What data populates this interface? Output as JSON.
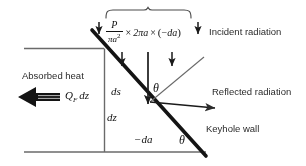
{
  "figure": {
    "type": "schematic-diagram"
  },
  "formula": {
    "numerator": "P",
    "denominator_base": "πa",
    "denominator_exp": "2",
    "times1": "×",
    "term2": "2πa",
    "times2": "×",
    "open_paren": "(",
    "minus": "−",
    "term3": "da",
    "close_paren": ")"
  },
  "labels": {
    "incident": "Incident radiation",
    "reflected": "Reflected radiation",
    "keyhole_wall": "Keyhole wall",
    "absorbed_heat": "Absorbed heat",
    "heat_flux_q": "Q",
    "heat_flux_sub": "F",
    "heat_flux_dz": "dz",
    "ds": "ds",
    "dz": "dz",
    "minus_da": "−da",
    "theta_upper": "θ",
    "theta_lower": "θ"
  },
  "colors": {
    "ink": "#1a1a1a",
    "wall_line": "#111111",
    "thin_line": "#555555",
    "background": "#ffffff"
  }
}
